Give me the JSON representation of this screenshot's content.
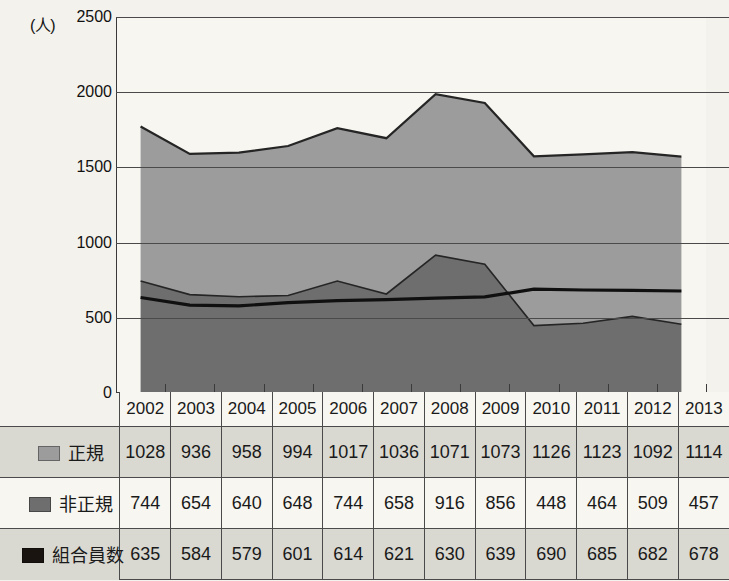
{
  "chart_data": {
    "type": "area",
    "stacked": true,
    "title": "",
    "subtitle": "",
    "xlabel": "",
    "ylabel": "",
    "unit_label": "(人)",
    "categories": [
      "2002",
      "2003",
      "2004",
      "2005",
      "2006",
      "2007",
      "2008",
      "2009",
      "2010",
      "2011",
      "2012",
      "2013"
    ],
    "ytick_labels": [
      "2500",
      "2000",
      "1500",
      "1000",
      "500",
      "0"
    ],
    "ylim": [
      0,
      2500
    ],
    "ytick_step": 500,
    "grid": true,
    "legend_position": "table-row-headers",
    "series": [
      {
        "name": "正規",
        "render": "stacked-area-top",
        "color": "#9c9c9c",
        "values": [
          1028,
          936,
          958,
          994,
          1017,
          1036,
          1071,
          1073,
          1126,
          1123,
          1092,
          1114
        ]
      },
      {
        "name": "非正規",
        "render": "stacked-area-bottom",
        "color": "#6e6e6e",
        "values": [
          744,
          654,
          640,
          648,
          744,
          658,
          916,
          856,
          448,
          464,
          509,
          457
        ]
      },
      {
        "name": "組合員数",
        "render": "line",
        "color": "#101010",
        "values": [
          635,
          584,
          579,
          601,
          614,
          621,
          630,
          639,
          690,
          685,
          682,
          678
        ]
      }
    ],
    "stack_totals": [
      1772,
      1590,
      1598,
      1642,
      1761,
      1694,
      1987,
      1929,
      1574,
      1587,
      1601,
      1571
    ]
  },
  "table": {
    "year_header": [
      "2002",
      "2003",
      "2004",
      "2005",
      "2006",
      "2007",
      "2008",
      "2009",
      "2010",
      "2011",
      "2012",
      "2013"
    ],
    "rows": [
      {
        "label": "正規",
        "swatch_color": "#9c9c9c",
        "values": [
          "1028",
          "936",
          "958",
          "994",
          "1017",
          "1036",
          "1071",
          "1073",
          "1126",
          "1123",
          "1092",
          "1114"
        ]
      },
      {
        "label": "非正規",
        "swatch_color": "#6e6e6e",
        "values": [
          "744",
          "654",
          "640",
          "648",
          "744",
          "658",
          "916",
          "856",
          "448",
          "464",
          "509",
          "457"
        ]
      },
      {
        "label": "組合員数",
        "swatch_color": "#1a1410",
        "values": [
          "635",
          "584",
          "579",
          "601",
          "614",
          "621",
          "630",
          "639",
          "690",
          "685",
          "682",
          "678"
        ]
      }
    ]
  },
  "colors": {
    "background": "#f3f2ec",
    "plot_background": "#f7f6f0",
    "series_seiki": "#9c9c9c",
    "series_hiseiki": "#6e6e6e",
    "series_kumiai": "#101010",
    "grid": "#4a4a4a",
    "row_shade": "#d9d8d1"
  }
}
